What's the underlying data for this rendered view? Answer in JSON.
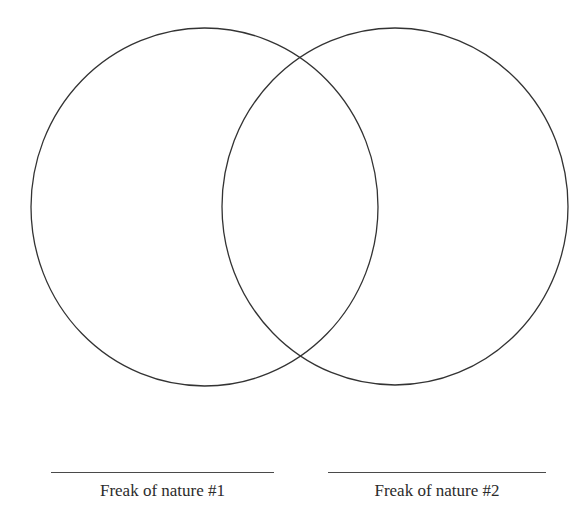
{
  "diagram": {
    "type": "venn",
    "stroke_color": "#333333",
    "background_color": "#ffffff",
    "circles": [
      {
        "id": "left",
        "cx": 204.5,
        "cy": 207,
        "rx": 173.5,
        "ry": 179
      },
      {
        "id": "right",
        "cx": 395,
        "cy": 206.5,
        "rx": 173,
        "ry": 178.5
      }
    ],
    "labels": [
      {
        "text": "Freak of nature #1"
      },
      {
        "text": "Freak of nature #2"
      }
    ]
  }
}
